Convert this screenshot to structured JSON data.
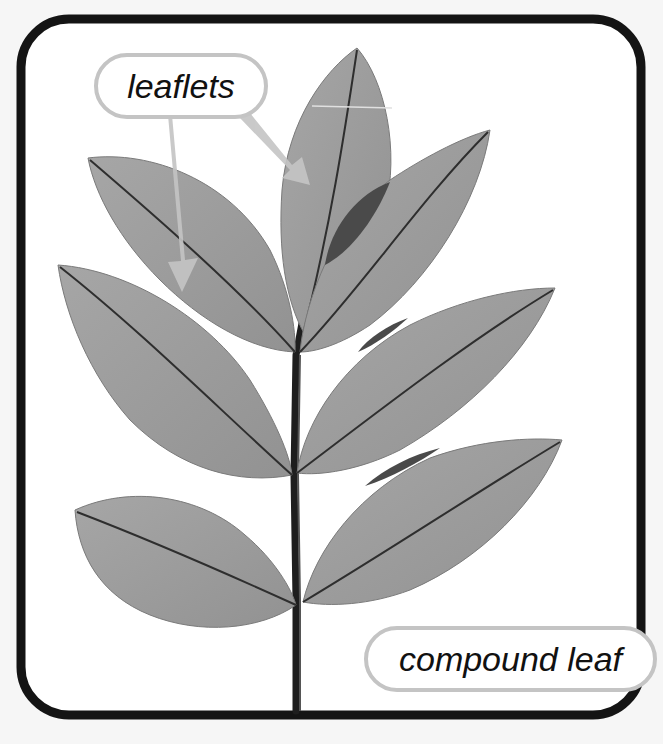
{
  "figure": {
    "title": "compound leaf",
    "type": "labeled botanical illustration",
    "background": "#f6f6f6",
    "frame": {
      "stroke": "#141414",
      "fill": "#ffffff",
      "corner": "rounded"
    }
  },
  "labels": {
    "leaflets": "leaflets",
    "compound_leaf": "compound leaf"
  },
  "callouts": [
    {
      "label": "leaflets",
      "arrows": 2,
      "points_to": [
        "upper-left leaflet",
        "terminal leaflet"
      ],
      "color": "#c4c4c4"
    },
    {
      "label": "compound leaf",
      "arrows": 0,
      "points_to": [
        "whole leaf"
      ],
      "color": "#c4c4c4"
    }
  ],
  "leaf": {
    "leaflet_count": 9,
    "arrangement": "pinnate, 4 opposite pairs + 1 terminal",
    "leaflets": [
      {
        "id": "terminal",
        "position": "top"
      },
      {
        "id": "upper-left",
        "position": "pair 1 left"
      },
      {
        "id": "upper-right",
        "position": "pair 1 right"
      },
      {
        "id": "middle-left",
        "position": "pair 2 left"
      },
      {
        "id": "middle-right",
        "position": "pair 2 right"
      },
      {
        "id": "lower-left",
        "position": "pair 3 left"
      },
      {
        "id": "lower-right",
        "position": "pair 3 right"
      }
    ],
    "colors": {
      "blade": "#9a9a9a",
      "blade_light": "#a8a8a8",
      "vein": "#2a2a2a",
      "overlap": "#4a4a4a",
      "rachis": "#222222"
    }
  }
}
